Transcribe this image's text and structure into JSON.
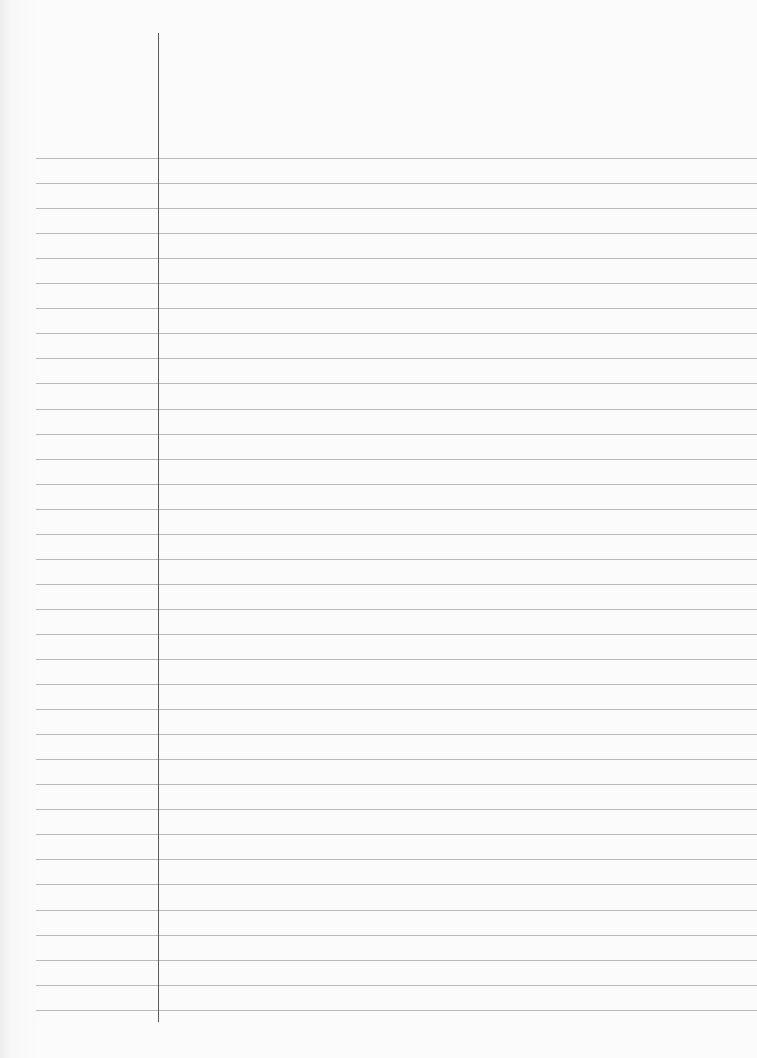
{
  "page": {
    "type": "ruled-notebook-paper",
    "content": "",
    "rule_count": 35,
    "rule_first_y": 158,
    "rule_spacing": 25.05,
    "rule_left_x": 36,
    "rule_color": "#b9b9b9",
    "margin_line": {
      "x": 158,
      "top": 33,
      "bottom": 1022,
      "color": "#5a5a5a"
    },
    "background_color": "#fbfbfb"
  }
}
